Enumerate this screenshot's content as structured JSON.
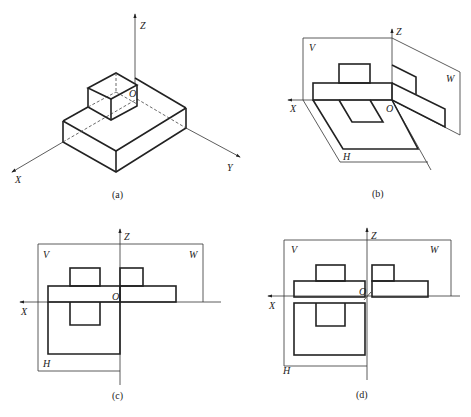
{
  "panels": {
    "a": {
      "caption": "(a)",
      "axes": {
        "x": "X",
        "y": "Y",
        "z": "Z",
        "origin": "O"
      },
      "description": "Isometric view of stepped block with origin O"
    },
    "b": {
      "caption": "(b)",
      "axes": {
        "x": "X",
        "z": "Z",
        "origin": "O"
      },
      "planes": {
        "v": "V",
        "w": "W",
        "h": "H"
      },
      "description": "Three-plane projection system in 3D with projections on V, W, H"
    },
    "c": {
      "caption": "(c)",
      "axes": {
        "x": "X",
        "z": "Z",
        "origin": "O"
      },
      "planes": {
        "v": "V",
        "w": "W",
        "h": "H"
      },
      "description": "Planes unfolded into one plane"
    },
    "d": {
      "caption": "(d)",
      "axes": {
        "x": "X",
        "z": "Z",
        "origin": "O"
      },
      "planes": {
        "v": "V",
        "w": "W",
        "h": "H"
      },
      "description": "Unfolded three-view drawing"
    }
  }
}
